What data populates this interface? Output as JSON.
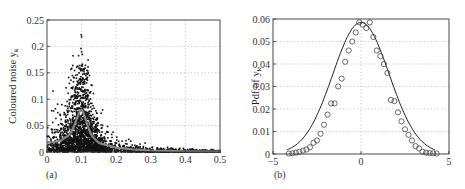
{
  "chart_data": [
    {
      "type": "scatter",
      "panel_label": "(a)",
      "title": "",
      "xlabel": "",
      "ylabel": "Coloured noise y",
      "ylabel_sub": "k",
      "xlim": [
        0,
        0.5
      ],
      "ylim": [
        0,
        0.25
      ],
      "xticks": [
        "0",
        "0.1",
        "0.2",
        "0.3",
        "0.4",
        "0.5"
      ],
      "yticks": [
        "0",
        "0.05",
        "0.1",
        "0.15",
        "0.2",
        "0.25"
      ],
      "grid": true,
      "series": [
        {
          "name": "periodogram samples",
          "style": "black dots",
          "description": "Dense scatter; peak near x=0.1 reaching ~0.22, low-frequency plateau ~0.02-0.05, decaying tail to ~0 by x=0.5"
        },
        {
          "name": "theoretical spectrum",
          "style": "gray line",
          "x": [
            0,
            0.02,
            0.04,
            0.06,
            0.07,
            0.08,
            0.09,
            0.095,
            0.1,
            0.105,
            0.11,
            0.12,
            0.13,
            0.15,
            0.2,
            0.25,
            0.3,
            0.4,
            0.5
          ],
          "y": [
            0.018,
            0.019,
            0.022,
            0.03,
            0.038,
            0.052,
            0.07,
            0.078,
            0.08,
            0.075,
            0.065,
            0.045,
            0.03,
            0.017,
            0.008,
            0.005,
            0.003,
            0.0015,
            0.001
          ]
        }
      ]
    },
    {
      "type": "line",
      "panel_label": "(b)",
      "title": "",
      "xlabel": "",
      "ylabel": "Pdf of y",
      "ylabel_sub": "k",
      "xlim": [
        -5,
        5
      ],
      "ylim": [
        0,
        0.06
      ],
      "xticks": [
        "-5",
        "0",
        "5"
      ],
      "yticks": [
        "0",
        "0.01",
        "0.02",
        "0.03",
        "0.04",
        "0.05",
        "0.06"
      ],
      "grid": true,
      "series": [
        {
          "name": "theoretical Gaussian pdf",
          "style": "solid line",
          "x": [
            -4.2,
            -3.5,
            -3,
            -2.5,
            -2,
            -1.5,
            -1,
            -0.5,
            0,
            0.5,
            1,
            1.5,
            2,
            2.5,
            3,
            3.5,
            4.2
          ],
          "y": [
            0.0002,
            0.001,
            0.003,
            0.007,
            0.0145,
            0.025,
            0.0395,
            0.0525,
            0.0585,
            0.0525,
            0.0395,
            0.025,
            0.0145,
            0.007,
            0.003,
            0.001,
            0.0002
          ]
        },
        {
          "name": "empirical pdf",
          "style": "open circles",
          "x": [
            -4.1,
            -3.9,
            -3.7,
            -3.5,
            -3.3,
            -3.1,
            -2.9,
            -2.7,
            -2.5,
            -2.3,
            -2.1,
            -1.9,
            -1.7,
            -1.5,
            -1.3,
            -1.1,
            -0.9,
            -0.7,
            -0.5,
            -0.3,
            -0.1,
            0.1,
            0.3,
            0.5,
            0.7,
            0.9,
            1.1,
            1.3,
            1.5,
            1.7,
            1.9,
            2.1,
            2.3,
            2.5,
            2.7,
            2.9,
            3.1,
            3.3,
            3.5,
            3.7,
            3.9,
            4.1,
            4.3
          ],
          "y": [
            0.0002,
            0.0003,
            0.0006,
            0.001,
            0.0015,
            0.002,
            0.003,
            0.005,
            0.006,
            0.009,
            0.013,
            0.0175,
            0.0225,
            0.0225,
            0.03,
            0.0335,
            0.041,
            0.046,
            0.05,
            0.054,
            0.0585,
            0.0575,
            0.056,
            0.0585,
            0.052,
            0.046,
            0.0435,
            0.04,
            0.036,
            0.024,
            0.0235,
            0.0185,
            0.0145,
            0.011,
            0.0085,
            0.006,
            0.0035,
            0.0025,
            0.001,
            0.0006,
            0.0004,
            0.0003,
            0.0002
          ]
        }
      ]
    }
  ]
}
